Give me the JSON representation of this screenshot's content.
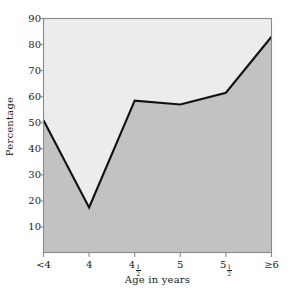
{
  "chart_data": {
    "type": "area",
    "title": "",
    "subtitle": "",
    "xlabel": "Age in years",
    "ylabel": "Percentage",
    "categories": [
      "<4",
      "4",
      "4½",
      "5",
      "5½",
      "≥6"
    ],
    "category_labels_raw": [
      "<4",
      "4",
      "4 1/2",
      "5",
      "5 1/2",
      ">=6"
    ],
    "values": [
      51,
      17.5,
      58.5,
      57,
      61.5,
      83
    ],
    "series": [
      {
        "name": "Percentage",
        "values": [
          51,
          17.5,
          58.5,
          57,
          61.5,
          83
        ]
      }
    ],
    "ylim": [
      0,
      90
    ],
    "xlim": [
      0,
      5
    ],
    "yticks": [
      10,
      20,
      30,
      40,
      50,
      60,
      70,
      80,
      90
    ],
    "ytick_labels": [
      "10",
      "20",
      "30",
      "40",
      "50",
      "60",
      "70",
      "80",
      "90"
    ],
    "grid": false,
    "legend": false,
    "legend_position": "none",
    "annotations": [],
    "colors": {
      "line": "#111111",
      "fill_below": "#c2c2c2",
      "fill_above": "#ececec",
      "axis": "#8a8a8a",
      "text": "#1a1a1a",
      "background": "#ffffff"
    }
  },
  "axes": {
    "y_title": "Percentage",
    "x_title": "Age in years"
  }
}
